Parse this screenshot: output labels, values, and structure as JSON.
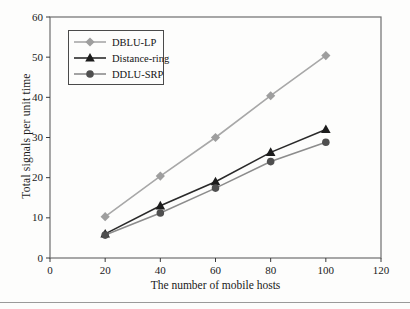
{
  "chart_data": {
    "type": "line",
    "title": "",
    "xlabel": "The number of mobile hosts",
    "ylabel": "Total signals per unit time",
    "xlim": [
      0,
      120
    ],
    "ylim": [
      0,
      60
    ],
    "x_ticks": [
      0,
      20,
      40,
      60,
      80,
      100,
      120
    ],
    "y_ticks": [
      0,
      10,
      20,
      30,
      40,
      50,
      60
    ],
    "grid": false,
    "legend_position": "top-left",
    "x": [
      20,
      40,
      60,
      80,
      100
    ],
    "series": [
      {
        "name": "DBLU-LP",
        "marker": "diamond",
        "color": "#9e9e9e",
        "line_color": "#a8a8a8",
        "values": [
          10.3,
          20.4,
          30.0,
          40.4,
          50.4
        ]
      },
      {
        "name": "Distance-ring",
        "marker": "triangle",
        "color": "#1c1c1c",
        "line_color": "#2a2a2a",
        "values": [
          6.0,
          13.0,
          19.0,
          26.3,
          32.0
        ]
      },
      {
        "name": "DDLU-SRP",
        "marker": "circle",
        "color": "#4f4f4f",
        "line_color": "#8c8c8c",
        "values": [
          5.7,
          11.2,
          17.4,
          24.0,
          28.8
        ]
      }
    ],
    "frame_color": "#6e6e6e",
    "tick_color": "#3a3a3a"
  },
  "page": {
    "bottom_rule_color": "#161616"
  }
}
